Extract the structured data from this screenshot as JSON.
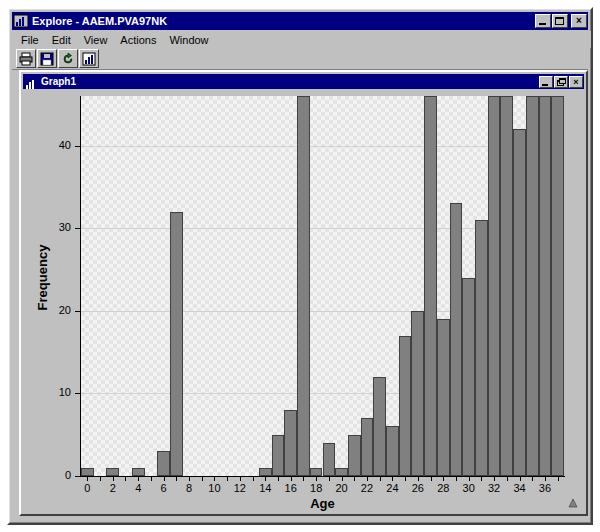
{
  "window": {
    "title": "Explore - AAEM.PVA97NK",
    "icon": "chart-app-icon",
    "controls": [
      {
        "name": "minimize-button",
        "glyph": "minimize"
      },
      {
        "name": "maximize-button",
        "glyph": "maximize"
      },
      {
        "name": "close-button",
        "glyph": "×"
      }
    ]
  },
  "menubar": {
    "items": [
      {
        "label": "File"
      },
      {
        "label": "Edit"
      },
      {
        "label": "View"
      },
      {
        "label": "Actions"
      },
      {
        "label": "Window"
      }
    ]
  },
  "toolbar": {
    "buttons": [
      {
        "name": "print-button",
        "icon": "printer-icon"
      },
      {
        "name": "save-button",
        "icon": "floppy-disk-icon"
      },
      {
        "name": "refresh-button",
        "icon": "refresh-arrow-icon"
      },
      {
        "name": "graph-button",
        "icon": "bar-chart-icon"
      }
    ]
  },
  "mdi_window": {
    "title": "Graph1",
    "icon": "bar-chart-icon",
    "controls": [
      {
        "name": "minimize-button",
        "glyph": "minimize"
      },
      {
        "name": "restore-button",
        "glyph": "restore"
      },
      {
        "name": "close-button",
        "glyph": "×"
      }
    ]
  },
  "status": {
    "corner_icon": "resize-grip-icon"
  },
  "chart_data": {
    "type": "bar",
    "title": "",
    "xlabel": "Age",
    "ylabel": "Frequency",
    "xlim": [
      -0.5,
      37.5
    ],
    "ylim": [
      0,
      46
    ],
    "grid": true,
    "legend": null,
    "ytick_labels": [
      "0",
      "10",
      "20",
      "30",
      "40"
    ],
    "ytick_values": [
      0,
      10,
      20,
      30,
      40
    ],
    "xtick_labels": [
      "0",
      "2",
      "4",
      "6",
      "8",
      "10",
      "12",
      "14",
      "16",
      "18",
      "20",
      "22",
      "24",
      "26",
      "28",
      "30",
      "32",
      "34",
      "36"
    ],
    "xtick_values": [
      0,
      2,
      4,
      6,
      8,
      10,
      12,
      14,
      16,
      18,
      20,
      22,
      24,
      26,
      28,
      30,
      32,
      34,
      36
    ],
    "bar_color": "#808080",
    "bar_edge_color": "#404040",
    "plot_background": "#e4e4e4",
    "categories": [
      0,
      1,
      2,
      3,
      4,
      5,
      6,
      7,
      8,
      9,
      10,
      11,
      12,
      13,
      14,
      15,
      16,
      17,
      18,
      19,
      20,
      21,
      22,
      23,
      24,
      25,
      26,
      27,
      28,
      29,
      30,
      31,
      32,
      33,
      34,
      35,
      36,
      37
    ],
    "values": [
      1,
      0,
      1,
      0,
      1,
      0,
      3,
      32,
      0,
      0,
      0,
      0,
      0,
      0,
      1,
      5,
      8,
      46,
      1,
      4,
      1,
      5,
      7,
      12,
      6,
      17,
      20,
      46,
      19,
      33,
      24,
      31,
      46,
      46,
      42,
      46,
      46,
      46
    ],
    "clipped_values_note": "Bars reaching the top of the plot are clipped at the axis maximum",
    "clipped_at": [
      17,
      27,
      32,
      33,
      35,
      36,
      37
    ]
  }
}
